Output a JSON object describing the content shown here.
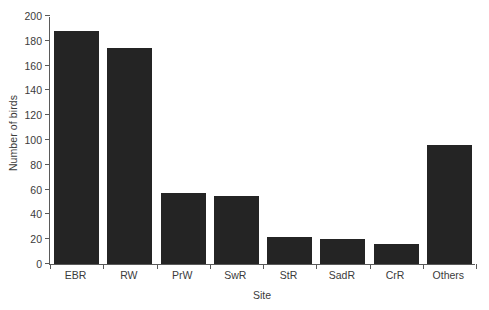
{
  "chart_data": {
    "type": "bar",
    "title": "",
    "xlabel": "Site",
    "ylabel": "Number of birds",
    "categories": [
      "EBR",
      "RW",
      "PrW",
      "SwR",
      "StR",
      "SadR",
      "CrR",
      "Others"
    ],
    "values": [
      188,
      174,
      57,
      55,
      22,
      20,
      16,
      96
    ],
    "ylim": [
      0,
      200
    ],
    "yticks": [
      0,
      20,
      40,
      60,
      80,
      100,
      120,
      140,
      160,
      180,
      200
    ],
    "ytick_labels": [
      "0",
      "20",
      "40",
      "60",
      "80",
      "100",
      "120",
      "140",
      "160",
      "180",
      "200"
    ],
    "grid": false,
    "legend": null,
    "bar_color": "#242424",
    "axis_color": "#5a5a5a",
    "text_color": "#3b3b3b",
    "background": "#ffffff"
  }
}
